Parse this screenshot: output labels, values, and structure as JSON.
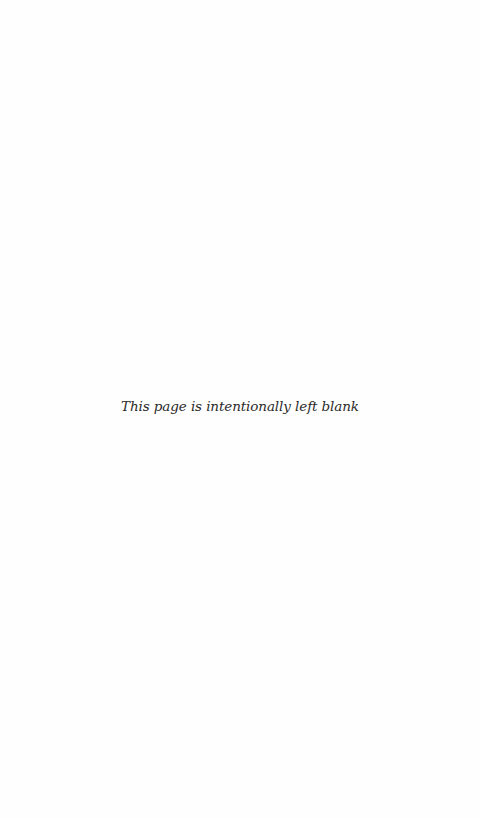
{
  "page": {
    "notice": "This page is intentionally left blank",
    "background_color": "#fefefe",
    "text_color": "#2a2a2a"
  }
}
